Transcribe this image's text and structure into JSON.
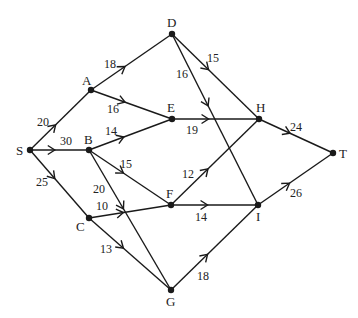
{
  "diagram": {
    "type": "directed-network",
    "stroke_color": "#1a1a1a",
    "nodes": [
      {
        "id": "S",
        "x": 30,
        "y": 150,
        "lx": 16,
        "ly": 155
      },
      {
        "id": "A",
        "x": 91,
        "y": 90,
        "lx": 82,
        "ly": 85
      },
      {
        "id": "B",
        "x": 89,
        "y": 150,
        "lx": 84,
        "ly": 144
      },
      {
        "id": "C",
        "x": 89,
        "y": 218,
        "lx": 76,
        "ly": 231
      },
      {
        "id": "D",
        "x": 172,
        "y": 34,
        "lx": 167,
        "ly": 27
      },
      {
        "id": "E",
        "x": 172,
        "y": 119,
        "lx": 167,
        "ly": 112
      },
      {
        "id": "F",
        "x": 171,
        "y": 205,
        "lx": 166,
        "ly": 198
      },
      {
        "id": "G",
        "x": 171,
        "y": 290,
        "lx": 166,
        "ly": 306
      },
      {
        "id": "H",
        "x": 259,
        "y": 119,
        "lx": 256,
        "ly": 112
      },
      {
        "id": "I",
        "x": 258,
        "y": 205,
        "lx": 256,
        "ly": 221
      },
      {
        "id": "T",
        "x": 333,
        "y": 153,
        "lx": 339,
        "ly": 158
      }
    ],
    "edges": [
      {
        "from": "S",
        "to": "A",
        "weight": "20",
        "lx": 37,
        "ly": 126
      },
      {
        "from": "S",
        "to": "B",
        "weight": "30",
        "lx": 60,
        "ly": 145
      },
      {
        "from": "S",
        "to": "C",
        "weight": "25",
        "lx": 36,
        "ly": 186
      },
      {
        "from": "A",
        "to": "D",
        "weight": "18",
        "lx": 104,
        "ly": 68
      },
      {
        "from": "A",
        "to": "E",
        "weight": "16",
        "lx": 107,
        "ly": 113
      },
      {
        "from": "B",
        "to": "E",
        "weight": "14",
        "lx": 105,
        "ly": 135
      },
      {
        "from": "B",
        "to": "F",
        "weight": "15",
        "lx": 120,
        "ly": 168
      },
      {
        "from": "B",
        "to": "G",
        "weight": "20",
        "lx": 93,
        "ly": 193
      },
      {
        "from": "C",
        "to": "F",
        "weight": "10",
        "lx": 96,
        "ly": 210
      },
      {
        "from": "C",
        "to": "G",
        "weight": "13",
        "lx": 100,
        "ly": 253
      },
      {
        "from": "D",
        "to": "H",
        "weight": "15",
        "lx": 207,
        "ly": 62
      },
      {
        "from": "D",
        "to": "I",
        "weight": "16",
        "lx": 176,
        "ly": 78
      },
      {
        "from": "E",
        "to": "H",
        "weight": "19",
        "lx": 186,
        "ly": 134
      },
      {
        "from": "F",
        "to": "H",
        "weight": "12",
        "lx": 182,
        "ly": 178
      },
      {
        "from": "F",
        "to": "I",
        "weight": "14",
        "lx": 195,
        "ly": 221
      },
      {
        "from": "G",
        "to": "I",
        "weight": "18",
        "lx": 197,
        "ly": 280
      },
      {
        "from": "H",
        "to": "T",
        "weight": "24",
        "lx": 290,
        "ly": 131
      },
      {
        "from": "I",
        "to": "T",
        "weight": "26",
        "lx": 290,
        "ly": 197
      }
    ]
  }
}
